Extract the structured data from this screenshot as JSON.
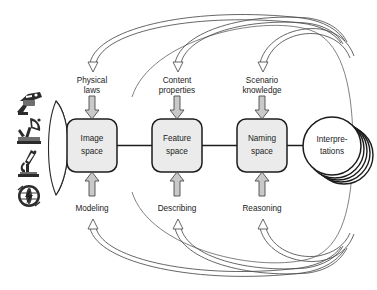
{
  "diagram": {
    "stages": [
      {
        "id": "image-space",
        "line1": "Image",
        "line2": "space"
      },
      {
        "id": "feature-space",
        "line1": "Feature",
        "line2": "space"
      },
      {
        "id": "naming-space",
        "line1": "Naming",
        "line2": "space"
      }
    ],
    "output": {
      "id": "interpretations",
      "line1": "Interpre-",
      "line2": "tations"
    },
    "top_inputs": [
      {
        "id": "physical-laws",
        "line1": "Physical",
        "line2": "laws"
      },
      {
        "id": "content-properties",
        "line1": "Content",
        "line2": "properties"
      },
      {
        "id": "scenario-knowledge",
        "line1": "Scenario",
        "line2": "knowledge"
      }
    ],
    "bottom_processes": [
      {
        "id": "modeling",
        "label": "Modeling"
      },
      {
        "id": "describing",
        "label": "Describing"
      },
      {
        "id": "reasoning",
        "label": "Reasoning"
      }
    ],
    "sensors": [
      {
        "id": "camera-icon",
        "name": "camera-icon"
      },
      {
        "id": "radar-icon",
        "name": "radar-dish-icon"
      },
      {
        "id": "microscope-icon",
        "name": "microscope-icon"
      },
      {
        "id": "globe-icon",
        "name": "globe-icon"
      }
    ],
    "colors": {
      "box_fill": "#ebebeb",
      "box_stroke": "#1c1c1c",
      "arrow_fill": "#c9c9c9",
      "arrow_stroke": "#4a4a4a",
      "curve_stroke": "#4b4b4b",
      "text": "#1b1b1b",
      "background": "#ffffff"
    }
  }
}
